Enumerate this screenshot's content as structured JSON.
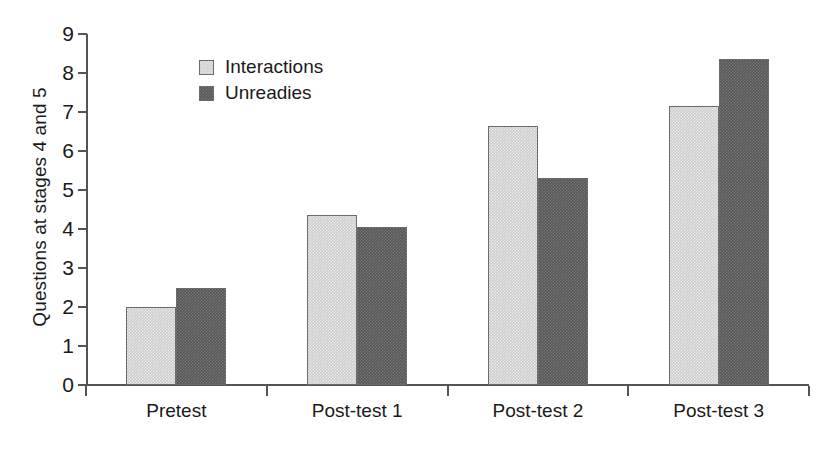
{
  "chart_data": {
    "type": "bar",
    "title": "",
    "subtitle": "",
    "xlabel": "",
    "ylabel": "Questions at stages 4 and 5",
    "categories": [
      "Pretest",
      "Post-test 1",
      "Post-test 2",
      "Post-test 3"
    ],
    "series": [
      {
        "name": "Interactions",
        "color": "#cdcdcd",
        "values": [
          2.0,
          4.35,
          6.65,
          7.15
        ]
      },
      {
        "name": "Unreadies",
        "color": "#575757",
        "values": [
          2.5,
          4.05,
          5.3,
          8.35
        ]
      }
    ],
    "ylim": [
      0,
      9
    ],
    "ytick_labels": [
      "0",
      "1",
      "2",
      "3",
      "4",
      "5",
      "6",
      "7",
      "8",
      "9"
    ],
    "ytick_values": [
      0,
      1,
      2,
      3,
      4,
      5,
      6,
      7,
      8,
      9
    ],
    "grid": false,
    "legend_position": "top-left-inside",
    "annotations": []
  },
  "legend": {
    "entries": [
      {
        "label": "Interactions",
        "color": "#cdcdcd"
      },
      {
        "label": "Unreadies",
        "color": "#575757"
      }
    ]
  },
  "axes": {
    "y_title": "Questions at stages 4 and 5",
    "y_ticks": [
      "9",
      "8",
      "7",
      "6",
      "5",
      "4",
      "3",
      "2",
      "1",
      "0"
    ],
    "x_categories": [
      "Pretest",
      "Post-test 1",
      "Post-test 2",
      "Post-test 3"
    ]
  },
  "colors": {
    "axis": "#545454",
    "text": "#1a1a1a",
    "background": "#ffffff",
    "series_light": "#cdcdcd",
    "series_dark": "#575757"
  }
}
